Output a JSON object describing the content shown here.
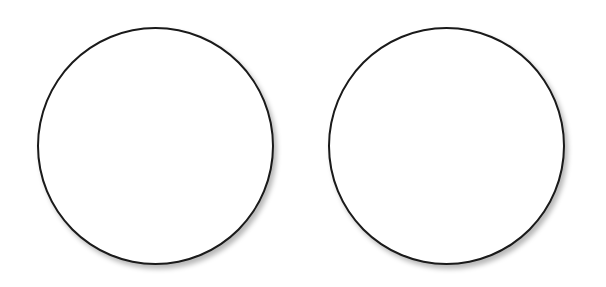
{
  "diagram": {
    "shapes": [
      {
        "type": "circle",
        "position": "left",
        "label": "",
        "stroke_color": "#1a1a1a",
        "fill_color": "#ffffff"
      },
      {
        "type": "circle",
        "position": "right",
        "label": "",
        "stroke_color": "#1a1a1a",
        "fill_color": "#ffffff"
      }
    ],
    "background_color": "#ffffff"
  }
}
